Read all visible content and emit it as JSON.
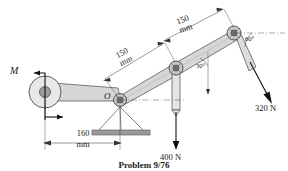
{
  "figure": {
    "caption": "Problem 9/76",
    "colors": {
      "link_fill": "#d6d6d6",
      "link_fill_light": "#e2e2e2",
      "link_stroke": "#4a4a4a",
      "line": "#1a1a1a",
      "ground_hatch": "#9a9a9a",
      "pin_dark": "#7a7a7a",
      "centerline": "#555555"
    }
  },
  "labels": {
    "moment": "M",
    "pivot_point": "O"
  },
  "dimensions": [
    {
      "id": "dim-150-lower",
      "value": "150",
      "unit": "mm"
    },
    {
      "id": "dim-150-upper",
      "value": "150",
      "unit": "mm"
    },
    {
      "id": "dim-160-base",
      "value": "160",
      "unit": "mm"
    }
  ],
  "angles": [
    {
      "id": "angle-30",
      "text": "30°"
    },
    {
      "id": "angle-60",
      "text": "60°"
    }
  ],
  "forces": [
    {
      "id": "force-400",
      "text": "400 N",
      "direction": "down"
    },
    {
      "id": "force-320",
      "text": "320 N",
      "direction": "down-right"
    }
  ]
}
